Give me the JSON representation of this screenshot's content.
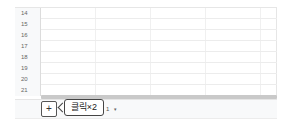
{
  "spreadsheet": {
    "rows": [
      {
        "number": "14"
      },
      {
        "number": "15"
      },
      {
        "number": "16"
      },
      {
        "number": "17"
      },
      {
        "number": "18"
      },
      {
        "number": "19"
      },
      {
        "number": "20"
      },
      {
        "number": "21"
      }
    ]
  },
  "tabbar": {
    "add_sheet_label": "+",
    "sheet_tab_label": "1",
    "sheet_tab_caret": "▾"
  },
  "annotation": {
    "text": "클릭×2"
  }
}
